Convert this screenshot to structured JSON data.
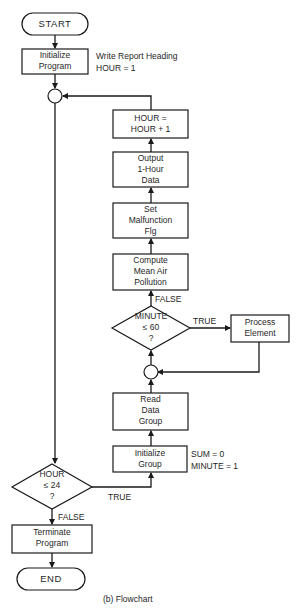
{
  "diagram": {
    "type": "flowchart",
    "caption": "(b) Flowchart",
    "nodes": {
      "start": {
        "kind": "terminator",
        "label": "START"
      },
      "init_program": {
        "kind": "process",
        "lines": [
          "Initialize",
          "Program"
        ],
        "note": [
          "Write Report Heading",
          "HOUR = 1"
        ]
      },
      "connector_outer": {
        "kind": "connector"
      },
      "hour_increment": {
        "kind": "process",
        "lines": [
          "HOUR =",
          "HOUR + 1"
        ]
      },
      "output_data": {
        "kind": "process",
        "lines": [
          "Output",
          "1-Hour",
          "Data"
        ]
      },
      "set_malfunction": {
        "kind": "process",
        "lines": [
          "Set",
          "Malfunction",
          "Flg"
        ]
      },
      "compute_mean": {
        "kind": "process",
        "lines": [
          "Compute",
          "Mean Air",
          "Pollution"
        ]
      },
      "minute_decision": {
        "kind": "decision",
        "lines": [
          "MINUTE",
          "≤ 60",
          "?"
        ]
      },
      "process_element": {
        "kind": "process",
        "lines": [
          "Process",
          "Element"
        ]
      },
      "connector_inner": {
        "kind": "connector"
      },
      "read_data": {
        "kind": "process",
        "lines": [
          "Read",
          "Data",
          "Group"
        ]
      },
      "init_group": {
        "kind": "process",
        "lines": [
          "Initialize",
          "Group"
        ],
        "note": [
          "SUM = 0",
          "MINUTE = 1"
        ]
      },
      "hour_decision": {
        "kind": "decision",
        "lines": [
          "HOUR",
          "≤ 24",
          "?"
        ]
      },
      "terminate": {
        "kind": "process",
        "lines": [
          "Terminate",
          "Program"
        ]
      },
      "end": {
        "kind": "terminator",
        "label": "END"
      }
    },
    "edge_labels": {
      "minute_false": "FALSE",
      "minute_true": "TRUE",
      "hour_true": "TRUE",
      "hour_false": "FALSE"
    },
    "edges": [
      {
        "from": "start",
        "to": "init_program"
      },
      {
        "from": "init_program",
        "to": "connector_outer"
      },
      {
        "from": "connector_outer",
        "to": "hour_decision"
      },
      {
        "from": "hour_decision",
        "to": "init_group",
        "label": "TRUE"
      },
      {
        "from": "hour_decision",
        "to": "terminate",
        "label": "FALSE"
      },
      {
        "from": "init_group",
        "to": "read_data"
      },
      {
        "from": "read_data",
        "to": "connector_inner"
      },
      {
        "from": "connector_inner",
        "to": "minute_decision"
      },
      {
        "from": "minute_decision",
        "to": "process_element",
        "label": "TRUE"
      },
      {
        "from": "process_element",
        "to": "connector_inner"
      },
      {
        "from": "minute_decision",
        "to": "compute_mean",
        "label": "FALSE"
      },
      {
        "from": "compute_mean",
        "to": "set_malfunction"
      },
      {
        "from": "set_malfunction",
        "to": "output_data"
      },
      {
        "from": "output_data",
        "to": "hour_increment"
      },
      {
        "from": "hour_increment",
        "to": "connector_outer"
      },
      {
        "from": "terminate",
        "to": "end"
      }
    ]
  }
}
